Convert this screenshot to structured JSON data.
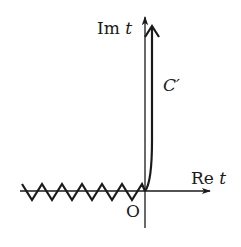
{
  "diagram": {
    "type": "complex-plane contour",
    "colors": {
      "ink": "#1a1a1a",
      "background": "#ffffff"
    },
    "axes": {
      "imaginary": {
        "label_main": "Im",
        "label_var": "t"
      },
      "real": {
        "label_main": "Re",
        "label_var": "t"
      },
      "origin_label": "O"
    },
    "contour": {
      "label": "C′",
      "arrowhead": "open-chevron",
      "direction": "upward"
    },
    "branch_cut": {
      "style": "zigzag",
      "along": "negative real axis",
      "teeth": 6
    }
  }
}
